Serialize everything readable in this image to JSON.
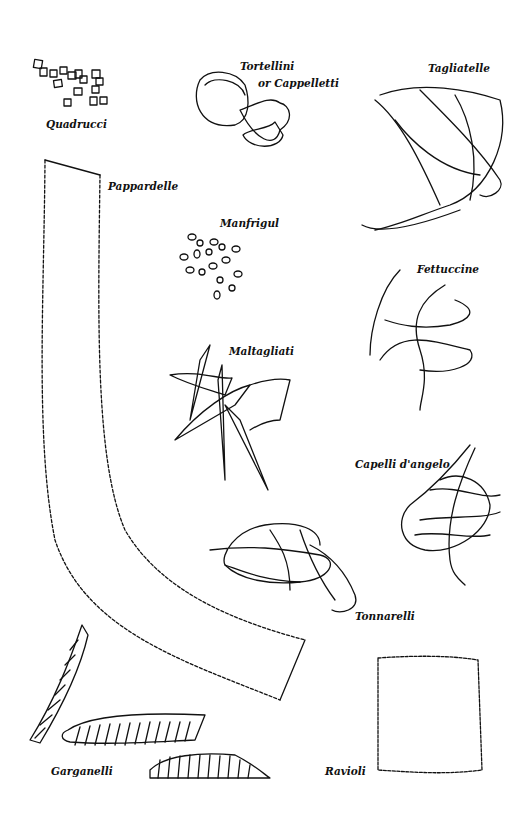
{
  "labels": {
    "quadrucci": "Quadrucci",
    "tortellini": "Tortellini",
    "cappelletti": "or Cappelletti",
    "tagliatelle": "Tagliatelle",
    "pappardelle": "Pappardelle",
    "manfrigul": "Manfrigul",
    "fettuccine": "Fettuccine",
    "maltagliati": "Maltagliati",
    "capelli": "Capelli d'angelo",
    "tonnarelli": "Tonnarelli",
    "garganelli": "Garganelli",
    "ravioli": "Ravioli"
  },
  "colors": {
    "ink": "#111111",
    "paper": "#ffffff",
    "stipple": "#888888"
  }
}
